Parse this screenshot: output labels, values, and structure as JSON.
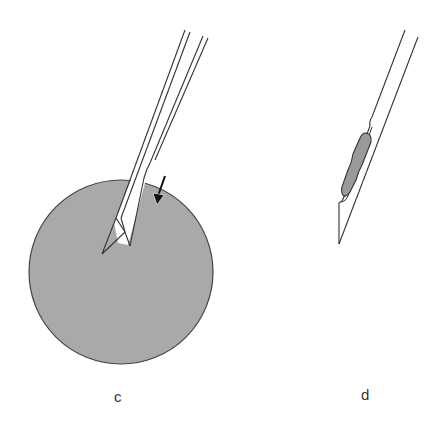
{
  "panels": [
    {
      "label": "c",
      "description": "needle inserted into tissue sphere, arrow indicating direction"
    },
    {
      "label": "d",
      "description": "needle with captured tissue sample in notch"
    }
  ],
  "colors": {
    "tissue": "#a9a9a9",
    "outline": "#333333",
    "sample": "#9a9a9a"
  }
}
